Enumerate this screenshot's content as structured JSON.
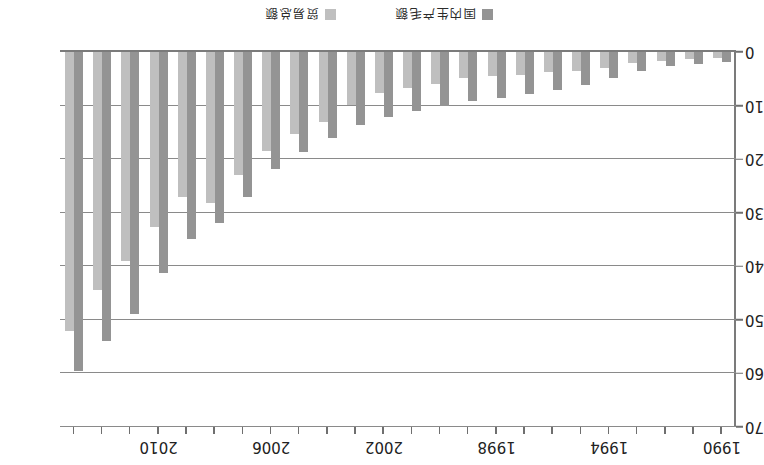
{
  "chart_data": {
    "type": "bar",
    "title": "",
    "xlabel": "",
    "ylabel": "",
    "ylim": [
      0,
      70
    ],
    "yticks": [
      0,
      10,
      20,
      30,
      40,
      50,
      60,
      70
    ],
    "xticks_shown": [
      "1990",
      "1994",
      "1998",
      "2002",
      "2006",
      "2010"
    ],
    "grid": true,
    "legend_position": "bottom",
    "orientation": "rotated-180",
    "categories": [
      "1990",
      "1991",
      "1992",
      "1993",
      "1994",
      "1995",
      "1996",
      "1997",
      "1998",
      "1999",
      "2000",
      "2001",
      "2002",
      "2003",
      "2004",
      "2005",
      "2006",
      "2007",
      "2008",
      "2009",
      "2010",
      "2011",
      "2012",
      "2013"
    ],
    "series": [
      {
        "name": "国内生产毛额",
        "color": "#949494",
        "values": [
          1.9,
          2.2,
          2.7,
          3.5,
          4.9,
          6.1,
          7.1,
          7.9,
          8.5,
          9.1,
          10.0,
          11.1,
          12.2,
          13.7,
          16.1,
          18.6,
          21.9,
          27.0,
          31.9,
          34.9,
          41.3,
          48.9,
          54.0,
          59.5
        ]
      },
      {
        "name": "贸易总额",
        "color": "#bfbfbf",
        "values": [
          1.1,
          1.4,
          1.6,
          2.0,
          3.0,
          3.5,
          3.8,
          4.3,
          4.5,
          4.8,
          5.9,
          6.8,
          7.6,
          9.9,
          13.0,
          15.4,
          18.5,
          23.0,
          28.2,
          27.0,
          32.6,
          39.0,
          44.5,
          52.0
        ]
      }
    ]
  },
  "legend": {
    "items": [
      {
        "label": "国内生产毛额",
        "color": "#949494"
      },
      {
        "label": "贸易总额",
        "color": "#bfbfbf"
      }
    ]
  }
}
